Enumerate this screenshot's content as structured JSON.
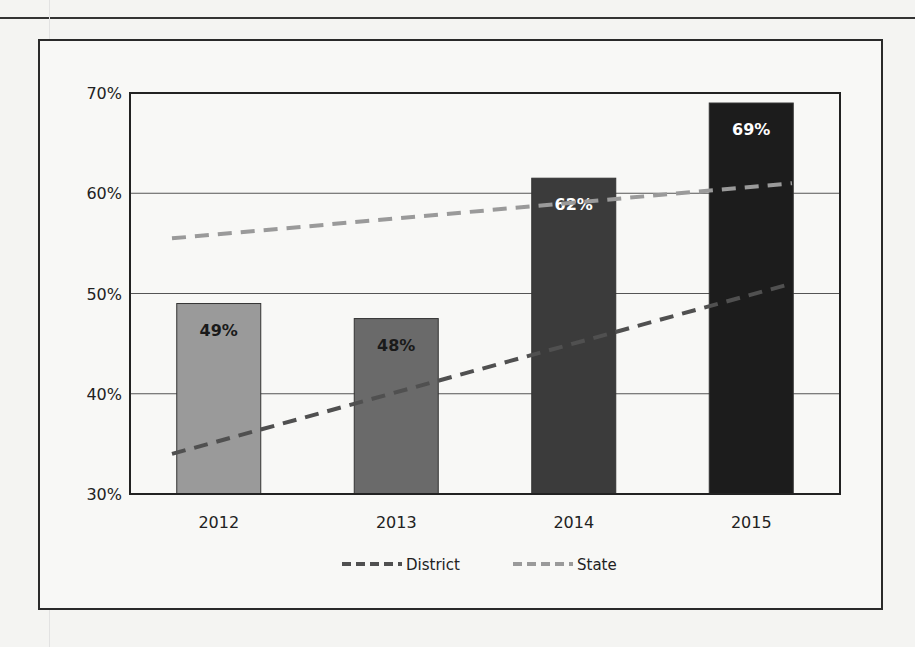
{
  "chart_data": {
    "type": "bar",
    "title": "",
    "xlabel": "",
    "ylabel": "",
    "categories": [
      "2012",
      "2013",
      "2014",
      "2015"
    ],
    "values": [
      49,
      47.5,
      61.5,
      69
    ],
    "bar_labels": [
      "49%",
      "48%",
      "62%",
      "69%"
    ],
    "bar_colors": [
      "#9a9a9a",
      "#6a6a6a",
      "#3b3b3b",
      "#1c1c1c"
    ],
    "bar_label_colors": [
      "#1a1a1a",
      "#1a1a1a",
      "#ffffff",
      "#ffffff"
    ],
    "ylim": [
      30,
      70
    ],
    "yticks": [
      30,
      40,
      50,
      60,
      70
    ],
    "ytick_labels": [
      "30%",
      "40%",
      "50%",
      "60%",
      "70%"
    ],
    "grid": true,
    "series": [
      {
        "name": "District",
        "type": "line",
        "style": "dashed",
        "color": "#505050",
        "start": 34,
        "end": 51
      },
      {
        "name": "State",
        "type": "line",
        "style": "dashed",
        "color": "#9a9a9a",
        "start": 55.5,
        "end": 61
      }
    ],
    "legend_position": "bottom-center"
  },
  "legend": {
    "district_label": "District",
    "state_label": "State"
  }
}
